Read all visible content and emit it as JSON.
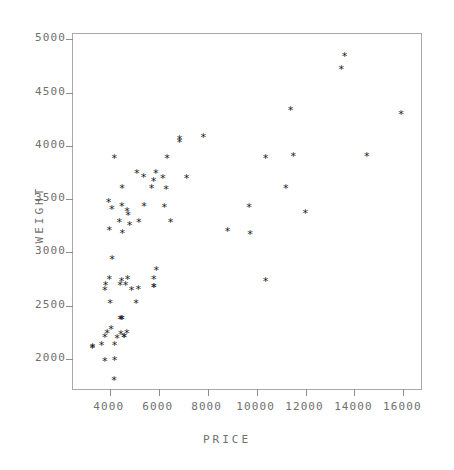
{
  "chart_data": {
    "type": "scatter",
    "title": "",
    "xlabel": "PRICE",
    "ylabel": "WEIGHT",
    "xlim": [
      2500,
      16800
    ],
    "ylim": [
      1700,
      5050
    ],
    "grid": false,
    "legend": null,
    "marker": "*",
    "marker_color": "#1a1a1a",
    "xticks": [
      4000,
      6000,
      8000,
      10000,
      12000,
      14000,
      16000
    ],
    "xtick_labels": [
      "4000",
      "6000",
      "8000",
      "10000",
      "12000",
      "14000",
      "16000"
    ],
    "yticks": [
      2000,
      2500,
      3000,
      3500,
      4000,
      4500,
      5000
    ],
    "ytick_labels": [
      "2000",
      "2500",
      "3000",
      "3500",
      "4000",
      "4500",
      "5000"
    ],
    "x": [
      4099,
      4749,
      3799,
      4816,
      7827,
      5788,
      4453,
      5189,
      10372,
      4082,
      11385,
      14500,
      15906,
      3299,
      5705,
      4504,
      5104,
      3667,
      3955,
      3984,
      4010,
      5886,
      6342,
      4389,
      4187,
      11497,
      13594,
      13466,
      3829,
      5379,
      6165,
      4516,
      6303,
      3291,
      8814,
      5172,
      4733,
      4890,
      4181,
      4195,
      10371,
      4647,
      4425,
      4482,
      6486,
      4060,
      3984,
      4499,
      4706,
      3799,
      6850,
      11995,
      11200,
      4195,
      4296,
      5799,
      4499,
      5899,
      4589,
      5079,
      5798,
      4425,
      3895,
      3798,
      5399,
      4697,
      9690,
      6229,
      4589,
      5799,
      4499,
      9735,
      6850,
      7140
    ],
    "y": [
      2930,
      3350,
      2640,
      3250,
      4080,
      3670,
      2230,
      3280,
      3880,
      3400,
      4330,
      3900,
      4290,
      2110,
      3600,
      3600,
      3740,
      2130,
      3470,
      3210,
      2520,
      3740,
      3880,
      3280,
      3880,
      3900,
      4840,
      4720,
      2690,
      3700,
      3690,
      3180,
      3590,
      2100,
      3200,
      2650,
      2750,
      2640,
      1800,
      1990,
      2730,
      2690,
      2370,
      2730,
      3280,
      2280,
      2750,
      3430,
      3380,
      2200,
      4030,
      3370,
      3600,
      2130,
      2190,
      2670,
      2370,
      2830,
      2200,
      2520,
      2750,
      2690,
      2240,
      1980,
      3430,
      2240,
      3420,
      3420,
      2200,
      2670,
      2370,
      3170,
      4060,
      3690
    ]
  },
  "axes": {
    "y_title": "WEIGHT",
    "x_title": "PRICE"
  }
}
